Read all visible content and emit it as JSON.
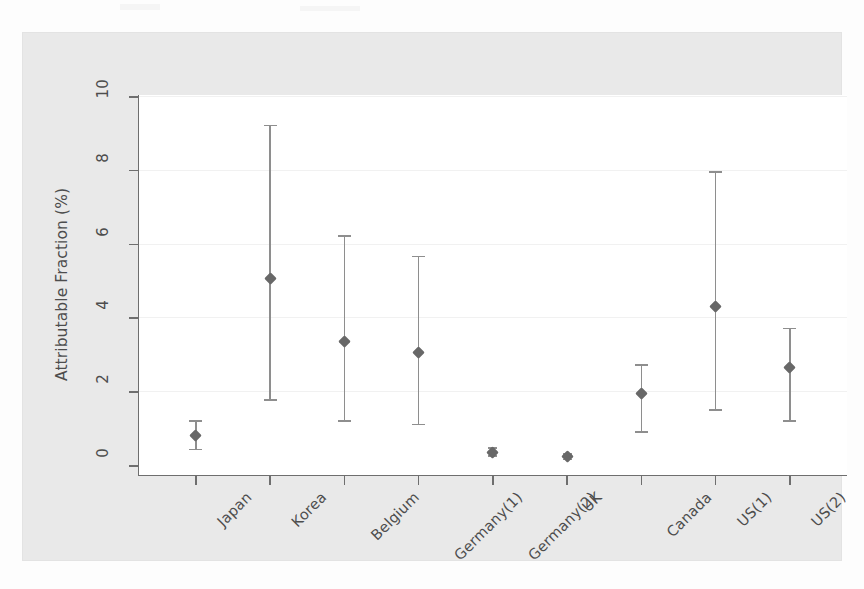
{
  "figure": {
    "background_color": "#e9e9e9",
    "plot_background_color": "#ffffff",
    "marker_color": "#686868",
    "ci_color": "#8e8e8e",
    "axis_color": "#6e6e6e"
  },
  "chart_data": {
    "type": "scatter",
    "title": "",
    "subtitle": "",
    "xlabel": "",
    "ylabel": "Attributable Fraction (%)",
    "ylim": [
      0,
      10
    ],
    "yticks": [
      0,
      2,
      4,
      6,
      8,
      10
    ],
    "ytick_labels": [
      "0",
      "2",
      "4",
      "6",
      "8",
      "10"
    ],
    "grid": true,
    "legend": "none",
    "categories": [
      "Japan",
      "Korea",
      "Belgium",
      "Germany(1)",
      "Germany(2)",
      "UK",
      "Canada",
      "US(1)",
      "US(2)"
    ],
    "series": [
      {
        "name": "Attributable Fraction",
        "values": [
          0.8,
          5.05,
          3.35,
          3.05,
          0.35,
          0.22,
          1.95,
          4.3,
          2.65
        ],
        "ci_lower": [
          0.42,
          1.76,
          1.2,
          1.1,
          0.25,
          0.15,
          0.9,
          1.5,
          1.2
        ],
        "ci_upper": [
          1.2,
          9.2,
          6.2,
          5.65,
          0.45,
          0.3,
          2.7,
          7.95,
          3.7
        ]
      }
    ]
  }
}
